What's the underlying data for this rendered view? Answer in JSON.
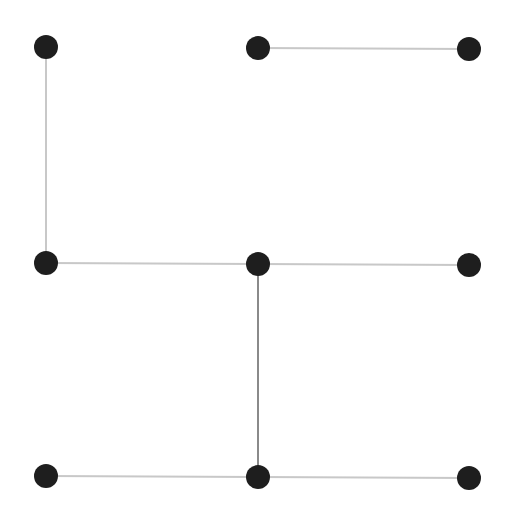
{
  "diagram": {
    "type": "graph",
    "width": 512,
    "height": 519,
    "node_radius": 12,
    "node_color": "#1e1e1e",
    "edge_color_light": "#c8c8c8",
    "edge_color_dark": "#8a8a8a",
    "nodes": [
      {
        "id": "n0",
        "row": 0,
        "col": 0,
        "x": 46,
        "y": 47
      },
      {
        "id": "n1",
        "row": 0,
        "col": 1,
        "x": 258,
        "y": 48
      },
      {
        "id": "n2",
        "row": 0,
        "col": 2,
        "x": 469,
        "y": 49
      },
      {
        "id": "n3",
        "row": 1,
        "col": 0,
        "x": 46,
        "y": 263
      },
      {
        "id": "n4",
        "row": 1,
        "col": 1,
        "x": 258,
        "y": 264
      },
      {
        "id": "n5",
        "row": 1,
        "col": 2,
        "x": 469,
        "y": 265
      },
      {
        "id": "n6",
        "row": 2,
        "col": 0,
        "x": 46,
        "y": 476
      },
      {
        "id": "n7",
        "row": 2,
        "col": 1,
        "x": 258,
        "y": 477
      },
      {
        "id": "n8",
        "row": 2,
        "col": 2,
        "x": 469,
        "y": 478
      }
    ],
    "edges": [
      {
        "from": "n0",
        "to": "n3",
        "style": "light"
      },
      {
        "from": "n1",
        "to": "n2",
        "style": "light"
      },
      {
        "from": "n3",
        "to": "n4",
        "style": "light"
      },
      {
        "from": "n4",
        "to": "n5",
        "style": "light"
      },
      {
        "from": "n4",
        "to": "n7",
        "style": "dark"
      },
      {
        "from": "n6",
        "to": "n7",
        "style": "light"
      },
      {
        "from": "n7",
        "to": "n8",
        "style": "light"
      }
    ]
  }
}
